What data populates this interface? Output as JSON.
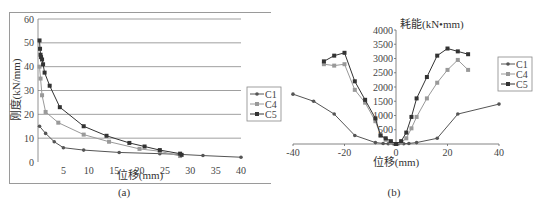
{
  "chart_data": [
    {
      "type": "line",
      "panel": "(a)",
      "title": "",
      "xlabel": "位移(mm)",
      "ylabel": "刚度(kN/mm)",
      "xlim": [
        0,
        40
      ],
      "ylim": [
        0,
        60
      ],
      "xticks": [
        0,
        5,
        10,
        15,
        20,
        25,
        30,
        35,
        40
      ],
      "yticks": [
        0,
        10,
        20,
        30,
        40,
        50,
        60
      ],
      "grid": "horizontal",
      "legend": [
        "C1",
        "C4",
        "C5"
      ],
      "legend_position": "right",
      "series": [
        {
          "name": "C1",
          "color": "#555555",
          "marker": "circle",
          "x": [
            0.3,
            1.5,
            3.2,
            5.0,
            9.0,
            16.0,
            24.0,
            28.0,
            32.5,
            40.0
          ],
          "y": [
            15.0,
            12.0,
            8.5,
            6.0,
            5.0,
            4.0,
            3.5,
            3.2,
            2.7,
            2.0
          ]
        },
        {
          "name": "C4",
          "color": "#999999",
          "marker": "square",
          "x": [
            0.3,
            0.5,
            0.8,
            1.5,
            4.0,
            9.0,
            14.0,
            20.0,
            24.0,
            28.0
          ],
          "y": [
            40.0,
            35.0,
            28.0,
            21.0,
            16.5,
            11.5,
            8.5,
            5.5,
            4.5,
            2.5
          ]
        },
        {
          "name": "C5",
          "color": "#333333",
          "marker": "square",
          "x": [
            0.3,
            0.4,
            0.5,
            0.6,
            0.8,
            1.0,
            1.3,
            2.3,
            4.3,
            9.0,
            13.5,
            18.0,
            21.0,
            24.0,
            28.0,
            28.3
          ],
          "y": [
            51.0,
            47.5,
            45.0,
            44.0,
            43.0,
            41.0,
            37.5,
            32.0,
            23.0,
            15.0,
            11.0,
            8.0,
            6.5,
            5.0,
            3.5,
            3.0
          ]
        }
      ]
    },
    {
      "type": "line",
      "panel": "(b)",
      "title": "",
      "xlabel": "位移(mm)",
      "ylabel": "耗能(kN•mm)",
      "xlim": [
        -40,
        40
      ],
      "ylim": [
        0,
        4000
      ],
      "xticks": [
        -40,
        -20,
        0,
        20,
        40
      ],
      "yticks": [
        0,
        500,
        1000,
        1500,
        2000,
        2500,
        3000,
        3500,
        4000
      ],
      "grid": "none",
      "legend": [
        "C1",
        "C4",
        "C5"
      ],
      "legend_position": "right",
      "series": [
        {
          "name": "C1",
          "color": "#555555",
          "marker": "circle",
          "x": [
            -40,
            -32,
            -24,
            -16,
            -8,
            -5,
            -3,
            -1,
            0,
            1,
            3,
            5,
            8,
            16,
            24,
            40
          ],
          "y": [
            1750,
            1500,
            1050,
            300,
            50,
            20,
            10,
            5,
            0,
            5,
            10,
            20,
            50,
            200,
            1050,
            1400
          ]
        },
        {
          "name": "C4",
          "color": "#999999",
          "marker": "square",
          "x": [
            -28,
            -24,
            -20,
            -16,
            -12,
            -8,
            -6,
            -4,
            -2,
            0,
            2,
            4,
            6,
            8,
            12,
            16,
            20,
            24,
            28
          ],
          "y": [
            2800,
            2750,
            2800,
            1900,
            1450,
            800,
            300,
            150,
            50,
            0,
            50,
            200,
            550,
            950,
            1600,
            2150,
            2600,
            2950,
            2600
          ]
        },
        {
          "name": "C5",
          "color": "#333333",
          "marker": "square",
          "x": [
            -28,
            -24,
            -20,
            -16,
            -12,
            -8,
            -6,
            -4,
            -2,
            0,
            2,
            4,
            6,
            8,
            12,
            16,
            20,
            24,
            28
          ],
          "y": [
            2900,
            3100,
            3200,
            2200,
            1550,
            900,
            300,
            200,
            100,
            0,
            100,
            400,
            950,
            1600,
            2350,
            3100,
            3350,
            3250,
            3150
          ]
        }
      ]
    }
  ],
  "panels": {
    "a": {
      "caption": "(a)",
      "xlabel": "位移(mm)",
      "ylabel": "刚度(kN/mm)"
    },
    "b": {
      "caption": "(b)",
      "xlabel": "位移(mm)",
      "ylabel": "耗能(kN•mm)"
    }
  },
  "legend": {
    "items": [
      "C1",
      "C4",
      "C5"
    ]
  },
  "colors": {
    "C1": "#555555",
    "C4": "#999999",
    "C5": "#333333",
    "grid": "#888888",
    "frame": "#9a9a9a"
  }
}
